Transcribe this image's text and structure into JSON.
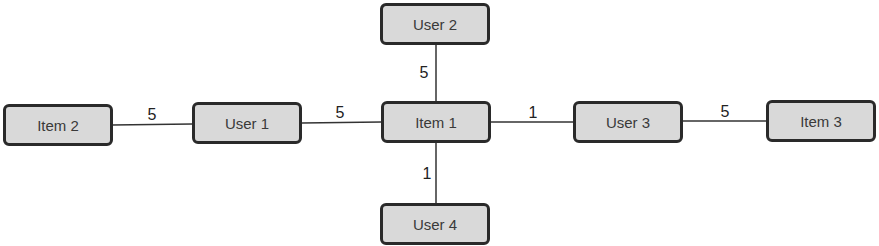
{
  "diagram": {
    "type": "bipartite-graph",
    "nodes": [
      {
        "id": "item2",
        "label": "Item 2",
        "x": 3,
        "y": 104
      },
      {
        "id": "user1",
        "label": "User 1",
        "x": 192,
        "y": 102
      },
      {
        "id": "item1",
        "label": "Item 1",
        "x": 381,
        "y": 101
      },
      {
        "id": "user2",
        "label": "User 2",
        "x": 380,
        "y": 3
      },
      {
        "id": "user4",
        "label": "User 4",
        "x": 380,
        "y": 203
      },
      {
        "id": "user3",
        "label": "User 3",
        "x": 573,
        "y": 101
      },
      {
        "id": "item3",
        "label": "Item 3",
        "x": 766,
        "y": 100
      }
    ],
    "edges": [
      {
        "from": "item2",
        "to": "user1",
        "weight": "5"
      },
      {
        "from": "user1",
        "to": "item1",
        "weight": "5"
      },
      {
        "from": "user2",
        "to": "item1",
        "weight": "5"
      },
      {
        "from": "item1",
        "to": "user4",
        "weight": "1"
      },
      {
        "from": "item1",
        "to": "user3",
        "weight": "1"
      },
      {
        "from": "user3",
        "to": "item3",
        "weight": "5"
      }
    ]
  }
}
